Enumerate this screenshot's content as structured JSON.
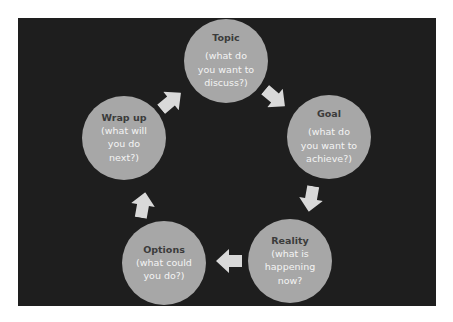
{
  "diagram": {
    "type": "cycle",
    "colors": {
      "background": "#ffffff",
      "panel": "#1e1e1e",
      "node_fill": "#a7a7a7",
      "title_text": "#3b3b3b",
      "sub_text": "#f4f4f4",
      "arrow": "#d9d9d9"
    },
    "nodes": [
      {
        "id": "topic",
        "title": "Topic",
        "lines": [
          "(what do",
          "you want to",
          "discuss?)"
        ]
      },
      {
        "id": "goal",
        "title": "Goal",
        "lines": [
          "(what do",
          "you want to",
          "achieve?)"
        ]
      },
      {
        "id": "reality",
        "title": "Reality",
        "lines": [
          "(what is",
          "happening",
          "now?"
        ]
      },
      {
        "id": "options",
        "title": "Options",
        "lines": [
          "(what could",
          "you do?)"
        ]
      },
      {
        "id": "wrapup",
        "title": "Wrap up",
        "lines": [
          "(what will",
          "you do",
          "next?)"
        ]
      }
    ],
    "edges": [
      {
        "from": "topic",
        "to": "goal",
        "icon": "arrow-down-right-icon"
      },
      {
        "from": "goal",
        "to": "reality",
        "icon": "arrow-down-icon"
      },
      {
        "from": "reality",
        "to": "options",
        "icon": "arrow-left-icon"
      },
      {
        "from": "options",
        "to": "wrapup",
        "icon": "arrow-up-icon"
      },
      {
        "from": "wrapup",
        "to": "topic",
        "icon": "arrow-up-right-icon"
      }
    ]
  }
}
